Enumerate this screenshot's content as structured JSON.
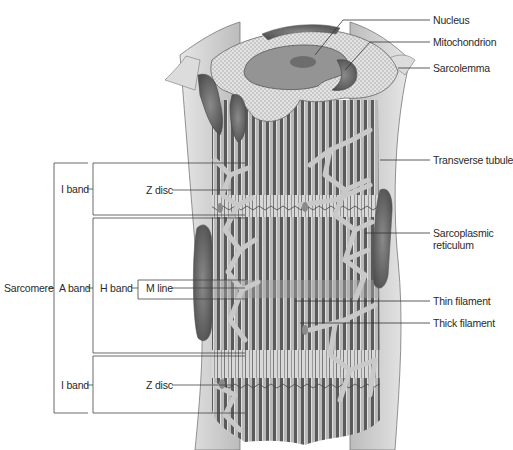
{
  "figure": {
    "colors": {
      "background": "#ffffff",
      "sarcolemma": "#cfcfcf",
      "cytoplasm_dots": "#d9d9d9",
      "nucleus": "#8f8f8f",
      "nucleolus": "#6f6f6f",
      "filament_dark": "#4d4d4d",
      "filament_light": "#c8c8c8",
      "reticulum": "#bdbdbd",
      "leader_line": "#333333"
    }
  },
  "labels_right": {
    "nucleus": "Nucleus",
    "mitochondrion": "Mitochondrion",
    "sarcolemma": "Sarcolemma",
    "transverse_tubule": "Transverse tubule",
    "sarcoplasmic_reticulum_line1": "Sarcoplasmic",
    "sarcoplasmic_reticulum_line2": "reticulum",
    "thin_filament": "Thin filament",
    "thick_filament": "Thick filament"
  },
  "labels_left": {
    "sarcomere": "Sarcomere",
    "i_band_top": "I band",
    "a_band": "A band",
    "i_band_bottom": "I band",
    "z_disc_top": "Z disc",
    "h_band": "H band",
    "m_line": "M line",
    "z_disc_bottom": "Z disc"
  }
}
